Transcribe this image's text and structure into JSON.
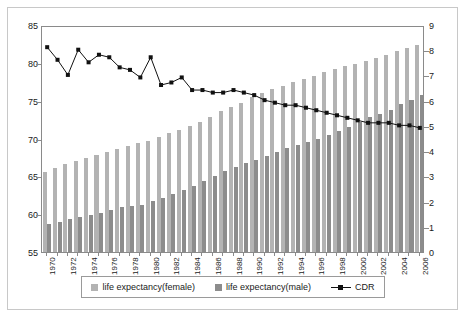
{
  "chart_data": {
    "type": "bar",
    "title": "",
    "subtitle": "",
    "xlabel": "",
    "ylabel": "",
    "y2label": "",
    "grid": false,
    "legend_position": "bottom",
    "ylim": [
      55,
      85
    ],
    "y2lim": [
      0,
      9
    ],
    "yticks": [
      55,
      60,
      65,
      70,
      75,
      80,
      85
    ],
    "y2ticks": [
      0,
      1,
      2,
      3,
      4,
      5,
      6,
      7,
      8,
      9
    ],
    "categories": [
      "1970",
      "1971",
      "1972",
      "1973",
      "1974",
      "1975",
      "1976",
      "1977",
      "1978",
      "1979",
      "1980",
      "1981",
      "1982",
      "1983",
      "1984",
      "1985",
      "1986",
      "1987",
      "1988",
      "1989",
      "1990",
      "1991",
      "1992",
      "1993",
      "1994",
      "1995",
      "1996",
      "1997",
      "1998",
      "1999",
      "2000",
      "2001",
      "2002",
      "2003",
      "2004",
      "2005",
      "2006"
    ],
    "xtick_labels": [
      "1970",
      "1972",
      "1974",
      "1976",
      "1978",
      "1980",
      "1982",
      "1984",
      "1986",
      "1988",
      "1990",
      "1992",
      "1994",
      "1996",
      "1998",
      "2000",
      "2002",
      "2004",
      "2006"
    ],
    "series": [
      {
        "name": "life expectancy(female)",
        "axis": "left",
        "kind": "bar",
        "color": "#b3b3b3",
        "values": [
          65.6,
          66.1,
          66.6,
          67.0,
          67.4,
          67.8,
          68.2,
          68.6,
          69.0,
          69.4,
          69.7,
          70.2,
          70.7,
          71.1,
          71.6,
          72.2,
          72.9,
          73.6,
          74.2,
          74.7,
          75.5,
          76.0,
          76.5,
          77.0,
          77.5,
          77.9,
          78.3,
          78.8,
          79.2,
          79.6,
          79.9,
          80.3,
          80.7,
          81.0,
          81.6,
          82.0,
          82.4
        ]
      },
      {
        "name": "life expectancy(male)",
        "axis": "left",
        "kind": "bar",
        "color": "#8c8c8c",
        "values": [
          58.7,
          59.0,
          59.3,
          59.6,
          59.9,
          60.2,
          60.5,
          60.9,
          61.1,
          61.2,
          61.7,
          62.2,
          62.7,
          63.2,
          63.7,
          64.4,
          65.0,
          65.7,
          66.2,
          66.7,
          67.2,
          67.7,
          68.2,
          68.7,
          69.2,
          69.5,
          70.0,
          70.5,
          71.0,
          71.5,
          72.2,
          72.8,
          73.3,
          73.8,
          74.5,
          75.1,
          75.7
        ]
      },
      {
        "name": "CDR",
        "axis": "right",
        "kind": "line",
        "color": "#111111",
        "values": [
          8.2,
          7.7,
          7.1,
          8.1,
          7.6,
          7.9,
          7.8,
          7.4,
          7.3,
          7.0,
          7.8,
          6.7,
          6.8,
          7.0,
          6.5,
          6.5,
          6.4,
          6.4,
          6.5,
          6.4,
          6.3,
          6.1,
          6.0,
          5.9,
          5.9,
          5.8,
          5.7,
          5.6,
          5.5,
          5.4,
          5.3,
          5.2,
          5.2,
          5.2,
          5.1,
          5.1,
          5.0
        ]
      }
    ]
  },
  "legend": {
    "items": [
      {
        "label": "life expectancy(female)",
        "type": "swatch",
        "color": "#b3b3b3"
      },
      {
        "label": "life expectancy(male)",
        "type": "swatch",
        "color": "#8c8c8c"
      },
      {
        "label": "CDR",
        "type": "line",
        "color": "#111111"
      }
    ]
  },
  "colors": {
    "female_bar": "#b3b3b3",
    "male_bar": "#8c8c8c",
    "line": "#111111",
    "axis": "#8a8a8a",
    "frame": "#c8c8c8",
    "text": "#1a1a1a",
    "background": "#ffffff"
  }
}
